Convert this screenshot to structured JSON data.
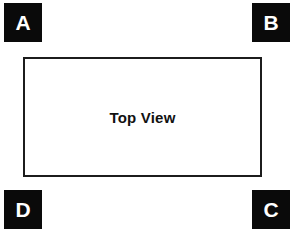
{
  "diagram": {
    "background_color": "#ffffff",
    "marker_fill_color": "#0a0a0a",
    "marker_text_color": "#ffffff",
    "rect_border_color": "#1c1c1c",
    "rect_label_color": "#111111",
    "corner_markers": [
      {
        "id": "a",
        "label": "A",
        "position": "top-left"
      },
      {
        "id": "b",
        "label": "B",
        "position": "top-right"
      },
      {
        "id": "c",
        "label": "C",
        "position": "bottom-right"
      },
      {
        "id": "d",
        "label": "D",
        "position": "bottom-left"
      }
    ],
    "center_rectangle": {
      "label": "Top View"
    }
  }
}
